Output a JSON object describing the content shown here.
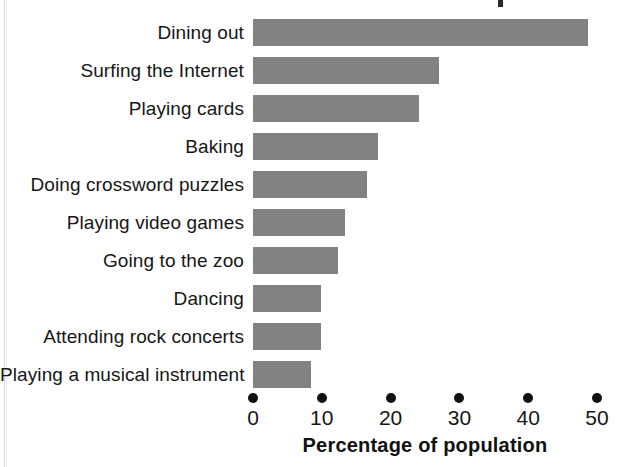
{
  "chart_data": {
    "type": "bar",
    "orientation": "horizontal",
    "title": "",
    "xlabel": "Percentage of population",
    "ylabel": "",
    "xlim": [
      0,
      50
    ],
    "xticks": [
      0,
      10,
      20,
      30,
      40,
      50
    ],
    "xtick_labels": [
      "0",
      "10",
      "20",
      "30",
      "40",
      "50"
    ],
    "grid": false,
    "legend": null,
    "bar_color": "#828282",
    "text_color": "#161616",
    "categories": [
      "Dining out",
      "Surfing the Internet",
      "Playing cards",
      "Baking",
      "Doing crossword puzzles",
      "Playing video games",
      "Going to the zoo",
      "Dancing",
      "Attending rock concerts",
      "Playing a musical instrument"
    ],
    "values": [
      48.7,
      27.1,
      24.2,
      18.1,
      16.5,
      13.4,
      12.3,
      9.9,
      9.9,
      8.4
    ]
  }
}
